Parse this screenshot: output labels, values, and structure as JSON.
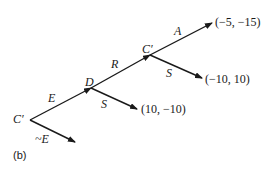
{
  "diagram": {
    "type": "game-tree",
    "caption": "(b)",
    "nodes": {
      "root": {
        "label": "C′"
      },
      "d": {
        "label": "D"
      },
      "c2": {
        "label": "C′"
      }
    },
    "edges": {
      "root_e": {
        "label": "E"
      },
      "root_not_e": {
        "label": "~E"
      },
      "d_s": {
        "label": "S"
      },
      "d_r": {
        "label": "R"
      },
      "c2_a": {
        "label": "A"
      },
      "c2_s": {
        "label": "S"
      }
    },
    "payoffs": {
      "d_s": "(10, −10)",
      "c2_a": "(−5, −15)",
      "c2_s": "(−10, 10)"
    },
    "colors": {
      "line": "#1a1a1a",
      "background": "#ffffff"
    }
  }
}
